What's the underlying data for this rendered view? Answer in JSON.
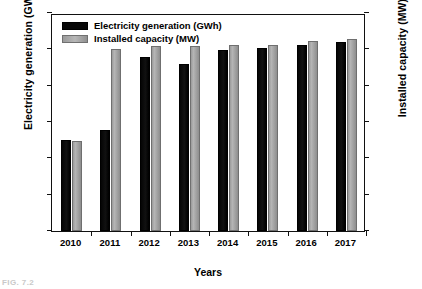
{
  "chart_data": {
    "type": "bar",
    "title": "",
    "xlabel": "Years",
    "ylabel": "Electricity generation (GWh)",
    "y2label": "Installed capacity (MW)",
    "categories": [
      "2010",
      "2011",
      "2012",
      "2013",
      "2014",
      "2015",
      "2016",
      "2017"
    ],
    "series": [
      {
        "name": "Electricity generation (GWh)",
        "axis": "left",
        "color": "#080808",
        "values": [
          500,
          556,
          958,
          919,
          996,
          1007,
          1022,
          1043
        ]
      },
      {
        "name": "Installed capacity (MW)",
        "axis": "right",
        "color": "#a8a8a8",
        "values": [
          247,
          501,
          509,
          510,
          513,
          513,
          524,
          528
        ]
      }
    ],
    "ylim": [
      0,
      1200
    ],
    "yticks": [
      "0",
      "200",
      "400",
      "600",
      "800",
      "1000",
      "1200"
    ],
    "y2lim": [
      0,
      600
    ],
    "y2ticks": [
      "0",
      "100",
      "200",
      "300",
      "400",
      "500",
      "600"
    ],
    "grid": false,
    "legend_position": "top-left",
    "legend": [
      {
        "label": "Electricity generation (GWh)",
        "swatch": "black"
      },
      {
        "label": "Installed capacity (MW)",
        "swatch": "gray"
      }
    ]
  },
  "caption": "FIG. 7.2"
}
